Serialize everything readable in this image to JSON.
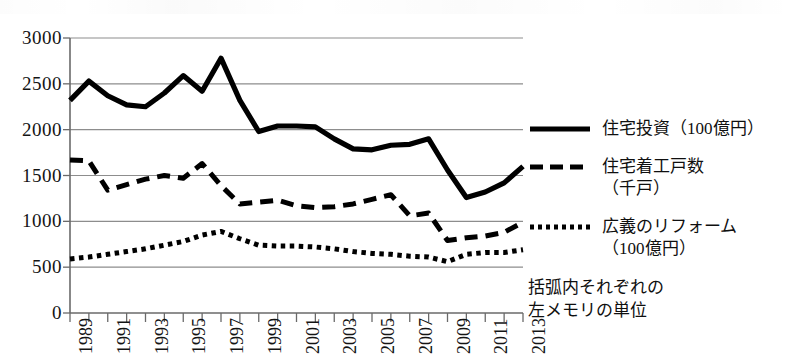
{
  "chart_data": {
    "type": "line",
    "title": "",
    "xlabel": "",
    "ylabel": "",
    "xlim": [
      1989,
      2013
    ],
    "ylim": [
      0,
      3000
    ],
    "yticks": [
      0,
      500,
      1000,
      1500,
      2000,
      2500,
      3000
    ],
    "ytick_labels": [
      "0",
      "500",
      "1000",
      "1500",
      "2000",
      "2500",
      "3000"
    ],
    "grid": true,
    "legend_position": "right",
    "x": [
      1989,
      1990,
      1991,
      1992,
      1993,
      1994,
      1995,
      1996,
      1997,
      1998,
      1999,
      2000,
      2001,
      2002,
      2003,
      2004,
      2005,
      2006,
      2007,
      2008,
      2009,
      2010,
      2011,
      2012,
      2013
    ],
    "xtick_labels": [
      "1989",
      "1991",
      "1993",
      "1995",
      "1997",
      "1999",
      "2001",
      "2003",
      "2005",
      "2007",
      "2009",
      "2011",
      "2013"
    ],
    "xtick_values": [
      1989,
      1991,
      1993,
      1995,
      1997,
      1999,
      2001,
      2003,
      2005,
      2007,
      2009,
      2011,
      2013
    ],
    "series": [
      {
        "name": "住宅投資（100億円）",
        "style": "solid",
        "color": "#000000",
        "values": [
          2320,
          2530,
          2370,
          2270,
          2250,
          2400,
          2590,
          2420,
          2780,
          2320,
          1980,
          2040,
          2040,
          2030,
          1900,
          1790,
          1780,
          1830,
          1840,
          1900,
          1560,
          1260,
          1320,
          1420,
          1600
        ]
      },
      {
        "name": "住宅着工戸数\n（千戸）",
        "style": "dashed",
        "color": "#000000",
        "values": [
          1670,
          1660,
          1340,
          1400,
          1460,
          1500,
          1470,
          1630,
          1390,
          1190,
          1210,
          1230,
          1170,
          1150,
          1160,
          1190,
          1240,
          1290,
          1060,
          1090,
          790,
          820,
          840,
          880,
          990
        ]
      },
      {
        "name": "広義のリフォーム\n（100億円）",
        "style": "dotted",
        "color": "#000000",
        "values": [
          590,
          610,
          640,
          670,
          700,
          740,
          780,
          850,
          890,
          810,
          740,
          730,
          730,
          720,
          700,
          670,
          650,
          640,
          620,
          610,
          560,
          640,
          660,
          660,
          690
        ]
      }
    ]
  },
  "legend": {
    "items": [
      {
        "label": "住宅投資（100億円）",
        "style": "solid",
        "swatch_name": "legend-swatch-solid"
      },
      {
        "label": "住宅着工戸数\n（千戸）",
        "style": "dashed",
        "swatch_name": "legend-swatch-dashed"
      },
      {
        "label": "広義のリフォーム\n（100億円）",
        "style": "dotted",
        "swatch_name": "legend-swatch-dotted"
      }
    ],
    "note": "括弧内それぞれの\n左メモリの単位"
  }
}
